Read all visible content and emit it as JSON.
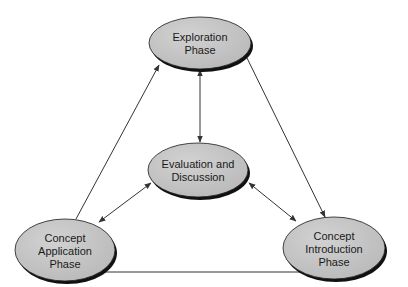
{
  "diagram": {
    "type": "cycle",
    "colors": {
      "node_fill": "#c4c4c4",
      "node_stroke": "#1a1a1a",
      "node_shadow": "#111111",
      "edge": "#333333",
      "background": "#ffffff"
    },
    "nodes": [
      {
        "id": "exploration",
        "lines": [
          "Exploration",
          "Phase"
        ],
        "cx": 200,
        "cy": 43,
        "rx": 51,
        "ry": 26
      },
      {
        "id": "evaluation",
        "lines": [
          "Evaluation and",
          "Discussion"
        ],
        "cx": 198,
        "cy": 170,
        "rx": 50,
        "ry": 27
      },
      {
        "id": "application",
        "lines": [
          "Concept",
          "Application",
          "Phase"
        ],
        "cx": 65,
        "cy": 250,
        "rx": 50,
        "ry": 31
      },
      {
        "id": "introduction",
        "lines": [
          "Concept",
          "Introduction",
          "Phase"
        ],
        "cx": 334,
        "cy": 248,
        "rx": 51,
        "ry": 31
      }
    ],
    "edges": [
      {
        "from": "application",
        "to": "exploration",
        "direction": "forward",
        "x1": 76,
        "y1": 219,
        "x2": 159,
        "y2": 65
      },
      {
        "from": "exploration",
        "to": "introduction",
        "direction": "forward",
        "x1": 247,
        "y1": 58,
        "x2": 325,
        "y2": 217
      },
      {
        "from": "introduction",
        "to": "application",
        "direction": "forward",
        "x1": 330,
        "y1": 272,
        "x2": 96,
        "y2": 272
      },
      {
        "from": "exploration",
        "to": "evaluation",
        "direction": "both",
        "x1": 200,
        "y1": 70,
        "x2": 200,
        "y2": 142
      },
      {
        "from": "evaluation",
        "to": "application",
        "direction": "both",
        "x1": 151,
        "y1": 183,
        "x2": 99,
        "y2": 222
      },
      {
        "from": "evaluation",
        "to": "introduction",
        "direction": "both",
        "x1": 249,
        "y1": 183,
        "x2": 296,
        "y2": 221
      }
    ]
  }
}
